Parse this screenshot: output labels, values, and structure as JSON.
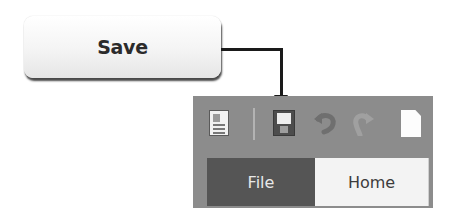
{
  "callout": {
    "label": "Save"
  },
  "quick_access_toolbar": {
    "items": [
      {
        "icon": "app-document-icon",
        "label": ""
      },
      {
        "icon": "separator",
        "label": ""
      },
      {
        "icon": "save-icon",
        "label": "Save",
        "highlighted": true
      },
      {
        "icon": "undo-icon",
        "label": ""
      },
      {
        "icon": "redo-icon",
        "label": ""
      },
      {
        "icon": "new-document-icon",
        "label": ""
      }
    ]
  },
  "ribbon_tabs": [
    {
      "label": "File",
      "active": true
    },
    {
      "label": "Home",
      "active": false
    }
  ],
  "colors": {
    "toolbar_bg": "#8c8c8c",
    "file_tab_bg": "#555555",
    "home_tab_bg": "#f3f3f3",
    "arrow": "#1a1a1a"
  }
}
